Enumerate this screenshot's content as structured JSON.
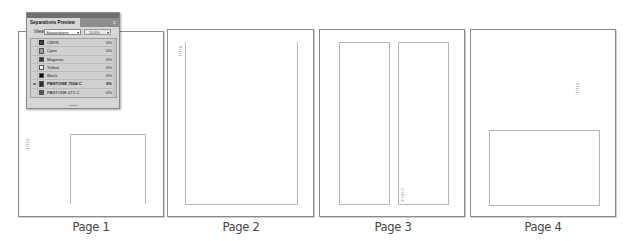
{
  "panel": {
    "title": "Separations Preview",
    "menu_icon": "≡",
    "view_label": "View:",
    "view_value": "Separations",
    "zoom_value": "100%",
    "inks": [
      {
        "name": "CMYK",
        "pct": "0%",
        "swatch": "#444444",
        "eye": false,
        "icon": "cmyk-icon"
      },
      {
        "name": "Cyan",
        "pct": "0%",
        "swatch": "#9a9a9a",
        "eye": false,
        "icon": "swatch"
      },
      {
        "name": "Magenta",
        "pct": "0%",
        "swatch": "#3a3a3a",
        "eye": false,
        "icon": "swatch"
      },
      {
        "name": "Yellow",
        "pct": "0%",
        "swatch": "#f4f4f4",
        "eye": false,
        "icon": "swatch"
      },
      {
        "name": "Black",
        "pct": "0%",
        "swatch": "#0a0a0a",
        "eye": false,
        "icon": "swatch"
      },
      {
        "name": "PANTONE 7554 C",
        "pct": "0%",
        "swatch": "#2a2a2a",
        "eye": true,
        "icon": "swatch"
      },
      {
        "name": "PANTONE 471 C",
        "pct": "0%",
        "swatch": "#555555",
        "eye": false,
        "icon": "swatch"
      }
    ]
  },
  "pages": [
    {
      "label": "Page 1",
      "slug": "TITLE"
    },
    {
      "label": "Page 2",
      "slug": "TITLE"
    },
    {
      "label": "Page 3",
      "slug": "FOLIO"
    },
    {
      "label": "Page 4",
      "slug": "TITLE"
    }
  ]
}
